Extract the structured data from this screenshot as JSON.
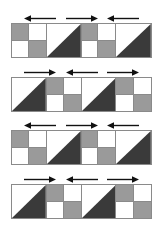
{
  "figure": {
    "background_color": "#ffffff",
    "outline_color": "#8a8a8a",
    "gray_fill": "#9a9a9a",
    "dark_fill": "#3a3a3a",
    "white_fill": "#ffffff",
    "panel_count": 4,
    "tiles_per_panel": 4,
    "arrows_per_panel": 3,
    "panels": [
      {
        "index": 1,
        "arrows": [
          {
            "direction": "left",
            "label": "←"
          },
          {
            "direction": "right",
            "label": "→"
          },
          {
            "direction": "left",
            "label": "←"
          }
        ],
        "tiles": [
          {
            "type": "checker",
            "quadrants": [
              "gray",
              "white",
              "white",
              "gray"
            ]
          },
          {
            "type": "triangle",
            "dark_corner": "bottom-right"
          },
          {
            "type": "checker",
            "quadrants": [
              "gray",
              "white",
              "white",
              "gray"
            ]
          },
          {
            "type": "triangle",
            "dark_corner": "bottom-right"
          }
        ]
      },
      {
        "index": 2,
        "arrows": [
          {
            "direction": "right",
            "label": "→"
          },
          {
            "direction": "left",
            "label": "←"
          },
          {
            "direction": "right",
            "label": "→"
          }
        ],
        "tiles": [
          {
            "type": "triangle",
            "dark_corner": "bottom-right"
          },
          {
            "type": "checker",
            "quadrants": [
              "gray",
              "white",
              "white",
              "gray"
            ]
          },
          {
            "type": "triangle",
            "dark_corner": "bottom-right"
          },
          {
            "type": "checker",
            "quadrants": [
              "gray",
              "white",
              "white",
              "gray"
            ]
          }
        ]
      },
      {
        "index": 3,
        "arrows": [
          {
            "direction": "left",
            "label": "←"
          },
          {
            "direction": "right",
            "label": "→"
          },
          {
            "direction": "left",
            "label": "←"
          }
        ],
        "tiles": [
          {
            "type": "checker",
            "quadrants": [
              "gray",
              "white",
              "white",
              "gray"
            ]
          },
          {
            "type": "triangle",
            "dark_corner": "bottom-right"
          },
          {
            "type": "checker",
            "quadrants": [
              "gray",
              "white",
              "white",
              "gray"
            ]
          },
          {
            "type": "triangle",
            "dark_corner": "bottom-right"
          }
        ]
      },
      {
        "index": 4,
        "arrows": [
          {
            "direction": "right",
            "label": "→"
          },
          {
            "direction": "left",
            "label": "←"
          },
          {
            "direction": "right",
            "label": "→"
          }
        ],
        "tiles": [
          {
            "type": "triangle",
            "dark_corner": "bottom-right"
          },
          {
            "type": "checker",
            "quadrants": [
              "gray",
              "white",
              "white",
              "gray"
            ]
          },
          {
            "type": "triangle",
            "dark_corner": "bottom-right"
          },
          {
            "type": "checker",
            "quadrants": [
              "gray",
              "white",
              "white",
              "gray"
            ]
          }
        ]
      }
    ],
    "geometry": {
      "panel_left": 11,
      "panel_width": 141,
      "tile_height": 35,
      "arrow_strip_height": 11,
      "panel_tops": [
        12,
        66,
        119,
        173
      ],
      "arrow_lefts": [
        24,
        66,
        107
      ]
    }
  }
}
